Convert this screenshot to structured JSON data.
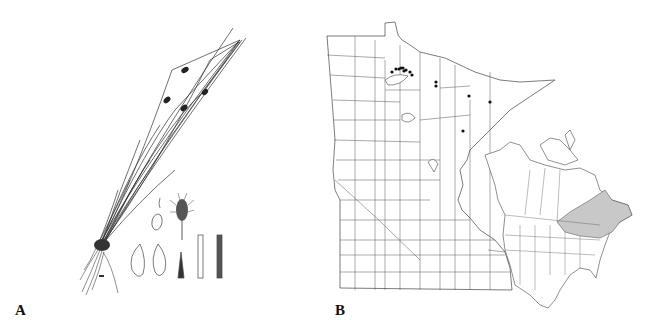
{
  "figure": {
    "panels": [
      {
        "id": "A",
        "label": "A",
        "description": "Botanical line illustration of a sedge-like plant: tufted base with roots, long slender culms with small dark spikelets near the tips, plus detail drawings of a perigynium/scales, spikelet, and culm/sheath sections"
      },
      {
        "id": "B",
        "label": "B",
        "description": "Distribution maps: Minnesota county map with specimen locality dots in the north, and North America inset map with shaded range in eastern Canada / northeastern United States"
      }
    ],
    "minnesota_map": {
      "locality_dots": [
        [
          392,
          72
        ],
        [
          396,
          69
        ],
        [
          399,
          69
        ],
        [
          401,
          68
        ],
        [
          403,
          68
        ],
        [
          406,
          70
        ],
        [
          404,
          71
        ],
        [
          410,
          72
        ],
        [
          412,
          75
        ],
        [
          436,
          82
        ],
        [
          436,
          86
        ],
        [
          469,
          96
        ],
        [
          490,
          102
        ],
        [
          463,
          131
        ]
      ],
      "dot_color": "#111111"
    },
    "north_america_map": {
      "range_fill_color": "#c8c8c8",
      "range_region": "eastern Canada and northeastern United States"
    },
    "colors": {
      "line": "#333333",
      "background": "#ffffff"
    }
  }
}
